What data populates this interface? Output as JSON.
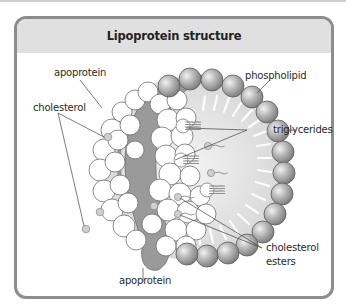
{
  "title": "Lipoprotein structure",
  "labels": {
    "apoprotein_top": "apoprotein",
    "cholesterol": "cholesterol",
    "phospholipid": "phospholipid",
    "triglycerides": "triglycerides",
    "cholesterol_esters_line1": "cholesterol",
    "cholesterol_esters_line2": "esters",
    "apoprotein_bottom": "apoprotein"
  },
  "colors": {
    "border": "#8d8d8d",
    "header": "#e0e0e0",
    "apoprotein_band": "#9a9a9a",
    "core": "#e4e4e4",
    "phospholipid": "#a8a8a8"
  }
}
